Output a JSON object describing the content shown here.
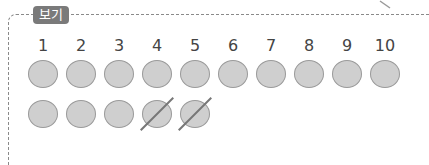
{
  "box": {
    "label": "보기",
    "numbers": [
      "1",
      "2",
      "3",
      "4",
      "5",
      "6",
      "7",
      "8",
      "9",
      "10"
    ],
    "row1_count": 10,
    "row2_count": 5,
    "row2_crossed": [
      3,
      4
    ]
  },
  "colors": {
    "label_bg": "#7a7a7a",
    "coin_fill": "#cfcfcf",
    "coin_border": "#9a9a9a",
    "border": "#8a8a8a"
  }
}
